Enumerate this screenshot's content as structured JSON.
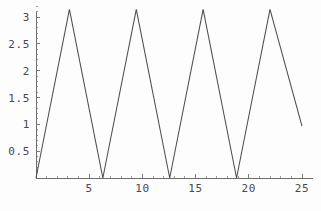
{
  "chart_data": {
    "type": "line",
    "title": "",
    "subtitle": "",
    "xlabel": "",
    "ylabel": "",
    "xlim": [
      0,
      25
    ],
    "ylim": [
      0,
      3.3
    ],
    "grid": false,
    "legend": null,
    "annotations": [],
    "axes": {
      "x": {
        "tick_labels": [
          "5",
          "10",
          "15",
          "20",
          "25"
        ],
        "tick_values": [
          5,
          10,
          15,
          20,
          25
        ],
        "minor_tick_values": [
          1,
          2,
          3,
          4,
          6,
          7,
          8,
          9,
          11,
          12,
          13,
          14,
          16,
          17,
          18,
          19,
          21,
          22,
          23,
          24
        ],
        "axis_position_y": 0
      },
      "y": {
        "tick_labels": [
          "0.5",
          "1",
          "1.5",
          "2",
          "2.5",
          "3"
        ],
        "tick_values": [
          0.5,
          1,
          1.5,
          2,
          2.5,
          3
        ],
        "minor_tick_values": [
          0.1,
          0.2,
          0.3,
          0.4,
          0.6,
          0.7,
          0.8,
          0.9,
          1.1,
          1.2,
          1.3,
          1.4,
          1.6,
          1.7,
          1.8,
          1.9,
          2.1,
          2.2,
          2.3,
          2.4,
          2.6,
          2.7,
          2.8,
          2.9,
          3.1,
          3.2
        ],
        "axis_position_x": 0
      }
    },
    "series": [
      {
        "name": "triangle-wave",
        "color": "#4d4d4d",
        "description": "Triangle wave of period 2*pi and amplitude pi, rising from 0 to pi then falling back to 0",
        "period": 6.2832,
        "amplitude": 3.1416,
        "x": [
          0,
          3.1416,
          6.2832,
          9.4248,
          12.5664,
          15.708,
          18.8496,
          21.9911,
          25
        ],
        "y": [
          0,
          3.1416,
          0,
          3.1416,
          0,
          3.1416,
          0,
          3.1416,
          0.9664
        ],
        "vertices": [
          {
            "x": 0,
            "y": 0,
            "kind": "start"
          },
          {
            "x": 3.1416,
            "y": 3.1416,
            "kind": "peak"
          },
          {
            "x": 6.2832,
            "y": 0,
            "kind": "valley"
          },
          {
            "x": 9.4248,
            "y": 3.1416,
            "kind": "peak"
          },
          {
            "x": 12.5664,
            "y": 0,
            "kind": "valley"
          },
          {
            "x": 15.708,
            "y": 3.1416,
            "kind": "peak"
          },
          {
            "x": 18.8496,
            "y": 0,
            "kind": "valley"
          },
          {
            "x": 21.9911,
            "y": 3.1416,
            "kind": "peak"
          },
          {
            "x": 25,
            "y": 0.9664,
            "kind": "end"
          }
        ]
      }
    ]
  },
  "colors": {
    "curve": "#4d4d4d",
    "axis": "#6e6e6e",
    "tick": "#7d7d7d",
    "tick_minor": "#9a9a9a",
    "text": "#4a4a4a",
    "background": "#fdfdfd"
  },
  "ticks": {
    "x_labels": [
      "5",
      "10",
      "15",
      "20",
      "25"
    ],
    "y_labels": [
      "0.5",
      "1",
      "1.5",
      "2",
      "2.5",
      "3"
    ]
  }
}
